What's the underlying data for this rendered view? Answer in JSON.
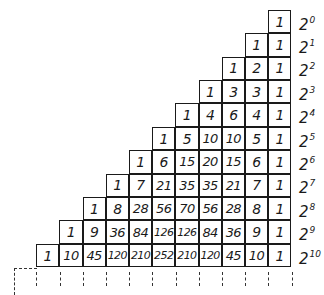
{
  "diagram": {
    "rows": [
      {
        "values": [
          "1"
        ],
        "sum_label": {
          "base": "2",
          "exp": "0"
        }
      },
      {
        "values": [
          "1",
          "1"
        ],
        "sum_label": {
          "base": "2",
          "exp": "1"
        }
      },
      {
        "values": [
          "1",
          "2",
          "1"
        ],
        "sum_label": {
          "base": "2",
          "exp": "2"
        }
      },
      {
        "values": [
          "1",
          "3",
          "3",
          "1"
        ],
        "sum_label": {
          "base": "2",
          "exp": "3"
        }
      },
      {
        "values": [
          "1",
          "4",
          "6",
          "4",
          "1"
        ],
        "sum_label": {
          "base": "2",
          "exp": "4"
        }
      },
      {
        "values": [
          "1",
          "5",
          "10",
          "10",
          "5",
          "1"
        ],
        "sum_label": {
          "base": "2",
          "exp": "5"
        }
      },
      {
        "values": [
          "1",
          "6",
          "15",
          "20",
          "15",
          "6",
          "1"
        ],
        "sum_label": {
          "base": "2",
          "exp": "6"
        }
      },
      {
        "values": [
          "1",
          "7",
          "21",
          "35",
          "35",
          "21",
          "7",
          "1"
        ],
        "sum_label": {
          "base": "2",
          "exp": "7"
        }
      },
      {
        "values": [
          "1",
          "8",
          "28",
          "56",
          "70",
          "56",
          "28",
          "8",
          "1"
        ],
        "sum_label": {
          "base": "2",
          "exp": "8"
        }
      },
      {
        "values": [
          "1",
          "9",
          "36",
          "84",
          "126",
          "126",
          "84",
          "36",
          "9",
          "1"
        ],
        "sum_label": {
          "base": "2",
          "exp": "9"
        }
      },
      {
        "values": [
          "1",
          "10",
          "45",
          "120",
          "210",
          "252",
          "210",
          "120",
          "45",
          "10",
          "1"
        ],
        "sum_label": {
          "base": "2",
          "exp": "10"
        }
      }
    ],
    "continuation": "dashed lines below indicating further rows",
    "colors": {
      "ink": "#1a1a1a",
      "background": "#ffffff"
    }
  }
}
